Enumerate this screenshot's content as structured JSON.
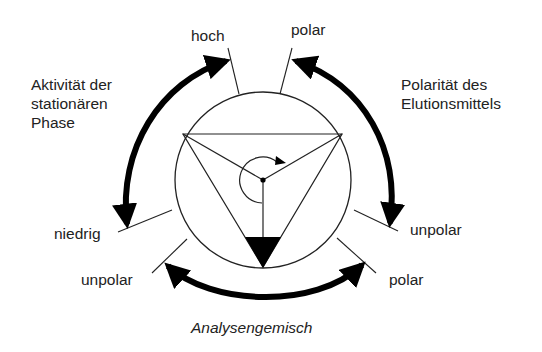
{
  "diagram": {
    "type": "chromatography-triangle",
    "colors": {
      "stroke": "#222222",
      "fill": "#000000",
      "background": "#ffffff"
    },
    "labels": {
      "activity_title": "Aktivität der\nstationären\nPhase",
      "polarity_title": "Polarität des\nElutionsmittels",
      "analyte_title": "Analysengemisch",
      "activity_high": "hoch",
      "activity_low": "niedrig",
      "eluent_polar": "polar",
      "eluent_unpolar": "unpolar",
      "analyte_unpolar": "unpolar",
      "analyte_polar": "polar"
    },
    "axes": [
      {
        "name": "Aktivität der stationären Phase",
        "from": "niedrig",
        "to": "hoch",
        "direction": "bidirectional"
      },
      {
        "name": "Polarität des Elutionsmittels",
        "from": "polar",
        "to": "unpolar",
        "direction": "bidirectional"
      },
      {
        "name": "Analysengemisch",
        "from": "unpolar",
        "to": "polar",
        "direction": "bidirectional"
      }
    ],
    "center": {
      "symbol": "rotatable triangle pointer",
      "rotation": "clockwise"
    }
  }
}
